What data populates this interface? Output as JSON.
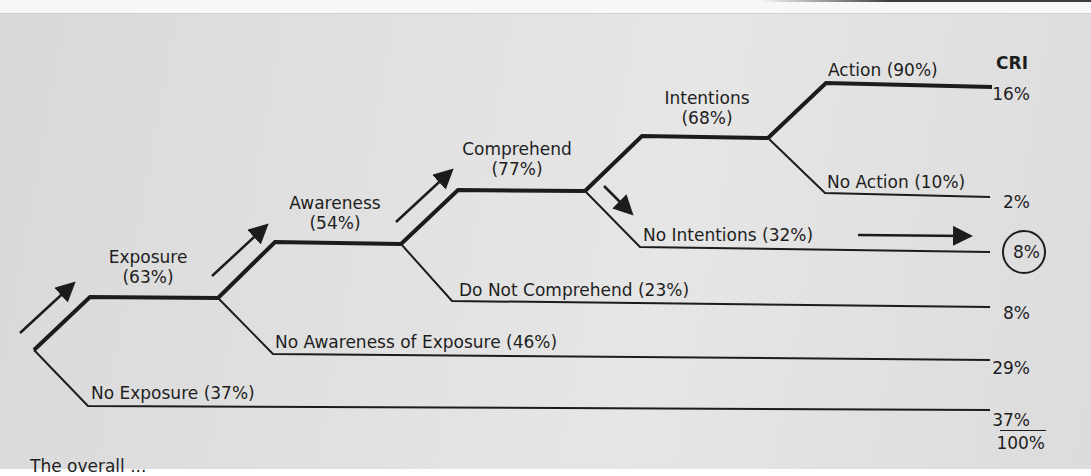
{
  "diagram": {
    "cri_header": "CRI",
    "nodes": {
      "exposure": {
        "label": "Exposure",
        "pct": "(63%)"
      },
      "awareness": {
        "label": "Awareness",
        "pct": "(54%)"
      },
      "comprehend": {
        "label": "Comprehend",
        "pct": "(77%)"
      },
      "intentions": {
        "label": "Intentions",
        "pct": "(68%)"
      },
      "action": {
        "label": "Action (90%)"
      },
      "no_action": {
        "label": "No Action (10%)"
      },
      "no_intentions": {
        "label": "No Intentions (32%)"
      },
      "do_not_comprehend": {
        "label": "Do Not Comprehend (23%)"
      },
      "no_awareness": {
        "label": "No Awareness of Exposure (46%)"
      },
      "no_exposure": {
        "label": "No Exposure (37%)"
      }
    },
    "cri_values": {
      "action": "16%",
      "no_action": "2%",
      "no_intentions": "8%",
      "do_not_comprehend": "8%",
      "no_awareness": "29%",
      "no_exposure": "37%",
      "total": "100%"
    },
    "highlighted_outcome": "no_intentions",
    "caption_partial": "The overall ..."
  },
  "colors": {
    "line": "#1c1c1c",
    "background": "#e0e0e0"
  }
}
